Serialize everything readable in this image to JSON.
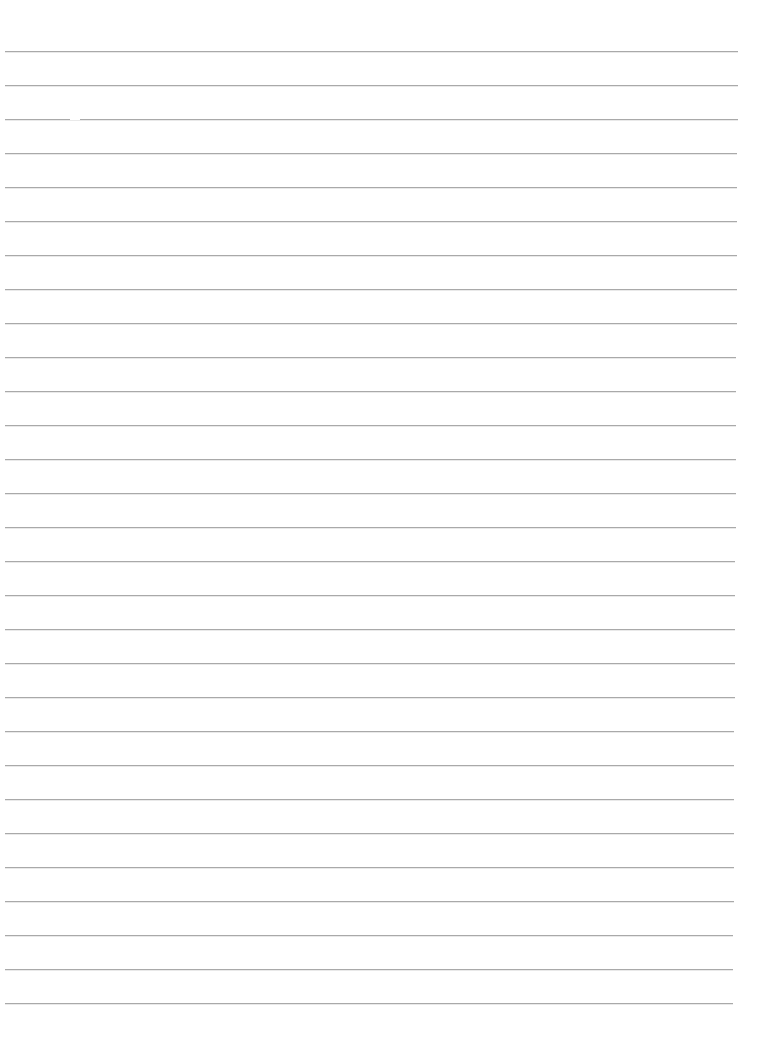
{
  "document": {
    "type": "ruled-paper",
    "background_color": "#ffffff",
    "line_color": "#a9a9a9",
    "line_count": 29,
    "first_line_y": 51,
    "line_spacing": 34,
    "line_left": 5,
    "line_right_top": 738,
    "line_right_bottom": 733,
    "text_content": []
  }
}
